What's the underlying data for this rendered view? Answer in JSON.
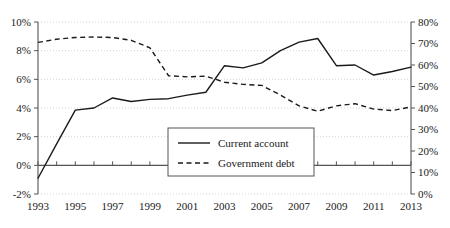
{
  "chart_data": {
    "type": "line",
    "title": "",
    "xlabel": "",
    "ylabel": "",
    "grid": true,
    "legend_position": "center-bottom-inside",
    "x": [
      1993,
      1994,
      1995,
      1996,
      1997,
      1998,
      1999,
      2000,
      2001,
      2002,
      2003,
      2004,
      2005,
      2006,
      2007,
      2008,
      2009,
      2010,
      2011,
      2012,
      2013
    ],
    "x_tick_labels": [
      "1993",
      "1995",
      "1997",
      "1999",
      "2001",
      "2003",
      "2005",
      "2007",
      "2009",
      "2011",
      "2013"
    ],
    "x_tick_values": [
      1993,
      1995,
      1997,
      1999,
      2001,
      2003,
      2005,
      2007,
      2009,
      2011,
      2013
    ],
    "xlim": [
      1993,
      2013
    ],
    "left_axis": {
      "label": "",
      "ylim": [
        -2,
        10
      ],
      "tick_values": [
        -2,
        0,
        2,
        4,
        6,
        8,
        10
      ],
      "tick_labels": [
        "-2%",
        "0%",
        "2%",
        "4%",
        "6%",
        "8%",
        "10%"
      ]
    },
    "right_axis": {
      "label": "",
      "ylim": [
        0,
        80
      ],
      "tick_values": [
        0,
        10,
        20,
        30,
        40,
        50,
        60,
        70,
        80
      ],
      "tick_labels": [
        "0%",
        "10%",
        "20%",
        "30%",
        "40%",
        "50%",
        "60%",
        "70%",
        "80%"
      ]
    },
    "series": [
      {
        "name": "Current account",
        "axis": "left",
        "style": "solid",
        "color": "#1a1a1a",
        "units": "%",
        "values": [
          -0.9,
          1.5,
          3.85,
          4.0,
          4.7,
          4.45,
          4.6,
          4.65,
          4.9,
          5.1,
          6.95,
          6.8,
          7.15,
          8.0,
          8.6,
          8.85,
          6.95,
          7.0,
          6.3,
          6.55,
          6.85
        ]
      },
      {
        "name": "Government debt",
        "axis": "right",
        "style": "dashed",
        "color": "#1a1a1a",
        "units": "%",
        "values": [
          70.5,
          72.0,
          72.8,
          73.0,
          72.8,
          71.5,
          68.0,
          55.0,
          54.5,
          54.8,
          52.0,
          51.0,
          50.5,
          46.0,
          41.0,
          38.5,
          41.0,
          42.0,
          39.5,
          38.8,
          40.5
        ]
      }
    ]
  },
  "legend": {
    "items": [
      {
        "label": "Current account",
        "style": "solid"
      },
      {
        "label": "Government debt",
        "style": "dashed"
      }
    ]
  }
}
